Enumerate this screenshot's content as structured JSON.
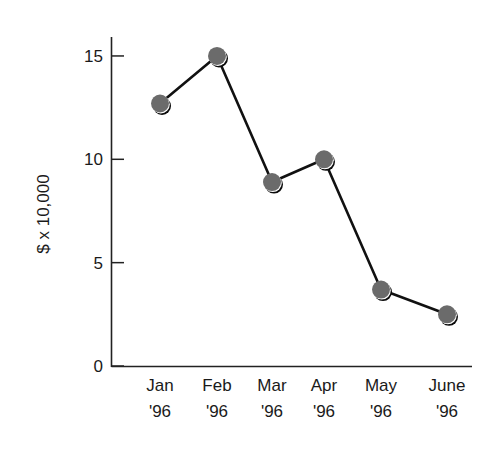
{
  "chart_data": {
    "type": "line",
    "title": "",
    "xlabel": "",
    "ylabel": "$ x 10,000",
    "categories": [
      "Jan '96",
      "Feb '96",
      "Mar '96",
      "Apr '96",
      "May '96",
      "June '96"
    ],
    "category_lines": [
      [
        "Jan",
        "'96"
      ],
      [
        "Feb",
        "'96"
      ],
      [
        "Mar",
        "'96"
      ],
      [
        "Apr",
        "'96"
      ],
      [
        "May",
        "'96"
      ],
      [
        "June",
        "'96"
      ]
    ],
    "series": [
      {
        "name": "Revenue",
        "values": [
          12.7,
          15.0,
          8.9,
          10.0,
          3.7,
          2.5
        ]
      }
    ],
    "ylim": [
      0,
      15.9
    ],
    "yticks": [
      0,
      5,
      10,
      15
    ],
    "grid": false,
    "legend": "none",
    "colors": {
      "marker": "#6b6b6b",
      "line": "#111111",
      "axis": "#222222"
    }
  }
}
